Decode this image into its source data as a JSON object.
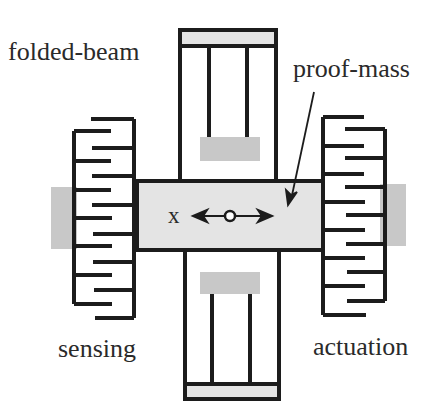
{
  "diagram": {
    "labels": {
      "folded_beam": "folded-beam",
      "proof_mass": "proof-mass",
      "sensing": "sensing",
      "actuation": "actuation",
      "axis": "x"
    },
    "colors": {
      "stroke": "#1c1c1c",
      "fill_gray": "#c8c8c8",
      "fill_light": "#e4e4e4",
      "background": "#ffffff"
    },
    "components": [
      {
        "name": "proof-mass",
        "shape": "rectangle"
      },
      {
        "name": "top-folded-beam",
        "shape": "folded beam"
      },
      {
        "name": "bottom-folded-beam",
        "shape": "folded beam"
      },
      {
        "name": "left-sensing-comb",
        "shape": "interdigitated comb"
      },
      {
        "name": "right-actuation-comb",
        "shape": "interdigitated comb"
      },
      {
        "name": "left-anchor",
        "shape": "gray pad"
      },
      {
        "name": "right-anchor",
        "shape": "gray pad"
      },
      {
        "name": "top-anchor",
        "shape": "gray pad"
      },
      {
        "name": "bottom-anchor",
        "shape": "gray pad"
      }
    ]
  }
}
